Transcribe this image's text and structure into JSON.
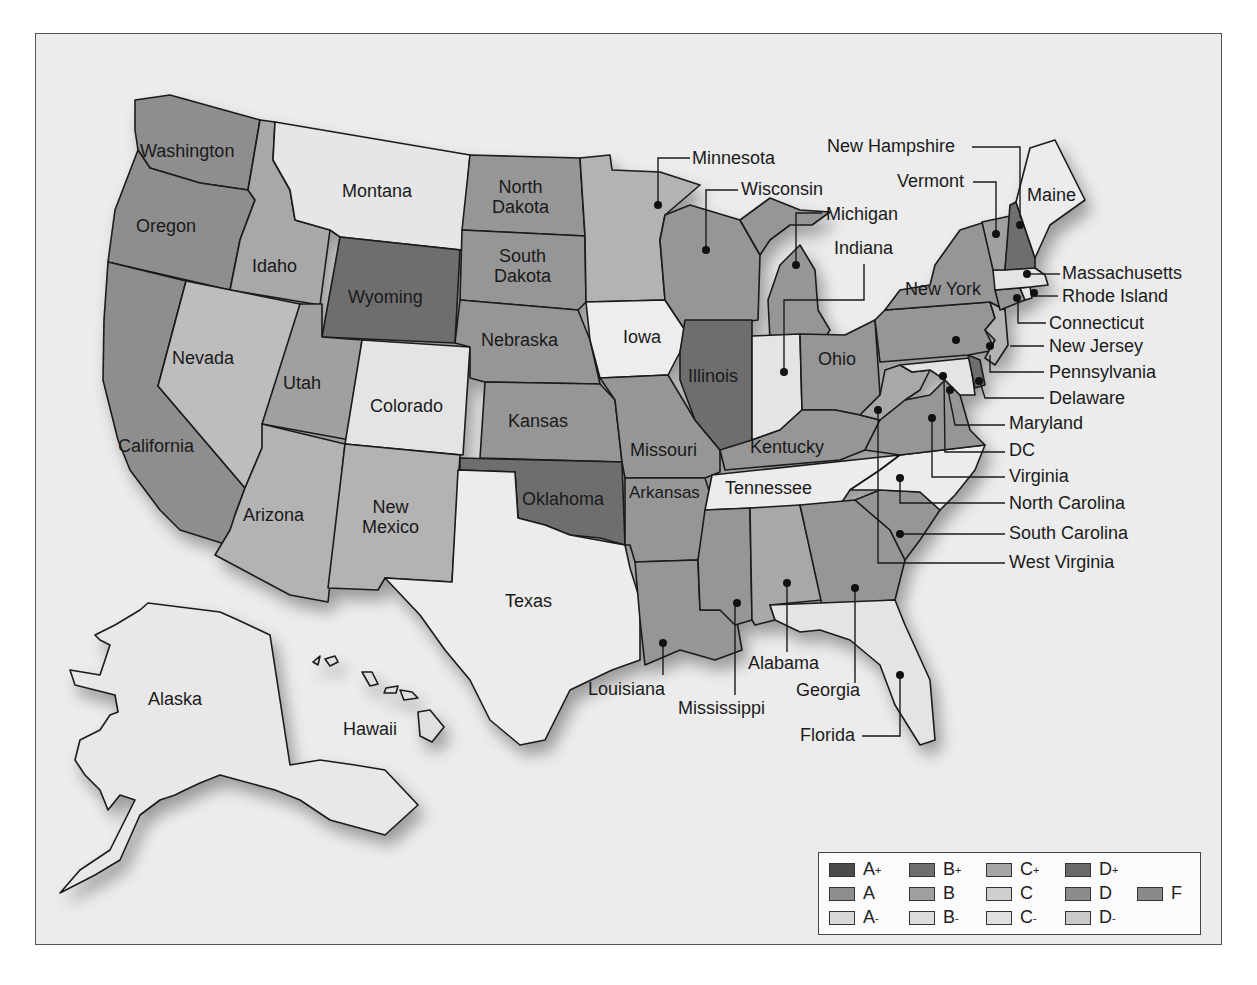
{
  "map": {
    "title_cutoff_visible": false,
    "states": [
      {
        "name": "Washington",
        "shade": "#8e8e8e",
        "grade_est": "A"
      },
      {
        "name": "Oregon",
        "shade": "#8e8e8e",
        "grade_est": "A"
      },
      {
        "name": "California",
        "shade": "#8e8e8e",
        "grade_est": "A"
      },
      {
        "name": "Idaho",
        "shade": "#a8a8a8",
        "grade_est": "B"
      },
      {
        "name": "Nevada",
        "shade": "#bdbdbd",
        "grade_est": "C"
      },
      {
        "name": "Montana",
        "shade": "#e6e6e6",
        "grade_est": "A-"
      },
      {
        "name": "Wyoming",
        "shade": "#6e6e6e",
        "grade_est": "D+"
      },
      {
        "name": "Utah",
        "shade": "#a0a0a0",
        "grade_est": "B"
      },
      {
        "name": "Colorado",
        "shade": "#e4e4e4",
        "grade_est": "B-"
      },
      {
        "name": "Arizona",
        "shade": "#b3b3b3",
        "grade_est": "C+"
      },
      {
        "name": "New Mexico",
        "shade": "#b3b3b3",
        "grade_est": "C+"
      },
      {
        "name": "North Dakota",
        "shade": "#969696",
        "grade_est": "A"
      },
      {
        "name": "South Dakota",
        "shade": "#969696",
        "grade_est": "A"
      },
      {
        "name": "Nebraska",
        "shade": "#969696",
        "grade_est": "A"
      },
      {
        "name": "Kansas",
        "shade": "#969696",
        "grade_est": "A"
      },
      {
        "name": "Oklahoma",
        "shade": "#6e6e6e",
        "grade_est": "D+"
      },
      {
        "name": "Texas",
        "shade": "#ececec",
        "grade_est": "C-"
      },
      {
        "name": "Minnesota",
        "shade": "#b3b3b3",
        "grade_est": "C+"
      },
      {
        "name": "Iowa",
        "shade": "#ededed",
        "grade_est": "A-"
      },
      {
        "name": "Missouri",
        "shade": "#969696",
        "grade_est": "A"
      },
      {
        "name": "Arkansas",
        "shade": "#969696",
        "grade_est": "A"
      },
      {
        "name": "Louisiana",
        "shade": "#969696",
        "grade_est": "A"
      },
      {
        "name": "Wisconsin",
        "shade": "#969696",
        "grade_est": "A"
      },
      {
        "name": "Illinois",
        "shade": "#6e6e6e",
        "grade_est": "D+"
      },
      {
        "name": "Michigan",
        "shade": "#969696",
        "grade_est": "A"
      },
      {
        "name": "Indiana",
        "shade": "#e4e4e4",
        "grade_est": "B-"
      },
      {
        "name": "Ohio",
        "shade": "#969696",
        "grade_est": "A"
      },
      {
        "name": "Kentucky",
        "shade": "#969696",
        "grade_est": "A"
      },
      {
        "name": "Tennessee",
        "shade": "#ececec",
        "grade_est": "C-"
      },
      {
        "name": "Mississippi",
        "shade": "#969696",
        "grade_est": "A"
      },
      {
        "name": "Alabama",
        "shade": "#a8a8a8",
        "grade_est": "B"
      },
      {
        "name": "Georgia",
        "shade": "#969696",
        "grade_est": "A"
      },
      {
        "name": "Florida",
        "shade": "#e4e4e4",
        "grade_est": "B-"
      },
      {
        "name": "South Carolina",
        "shade": "#969696",
        "grade_est": "A"
      },
      {
        "name": "North Carolina",
        "shade": "#ececec",
        "grade_est": "C-"
      },
      {
        "name": "Virginia",
        "shade": "#969696",
        "grade_est": "A"
      },
      {
        "name": "West Virginia",
        "shade": "#a8a8a8",
        "grade_est": "B"
      },
      {
        "name": "DC",
        "shade": "#e4e4e4",
        "grade_est": "B-"
      },
      {
        "name": "Maryland",
        "shade": "#e4e4e4",
        "grade_est": "B-"
      },
      {
        "name": "Delaware",
        "shade": "#6e6e6e",
        "grade_est": "D+"
      },
      {
        "name": "Pennsylvania",
        "shade": "#969696",
        "grade_est": "A"
      },
      {
        "name": "New Jersey",
        "shade": "#b3b3b3",
        "grade_est": "C+"
      },
      {
        "name": "New York",
        "shade": "#969696",
        "grade_est": "A"
      },
      {
        "name": "Connecticut",
        "shade": "#969696",
        "grade_est": "A"
      },
      {
        "name": "Rhode Island",
        "shade": "#e4e4e4",
        "grade_est": "B-"
      },
      {
        "name": "Massachusetts",
        "shade": "#e4e4e4",
        "grade_est": "B-"
      },
      {
        "name": "Vermont",
        "shade": "#a0a0a0",
        "grade_est": "B"
      },
      {
        "name": "New Hampshire",
        "shade": "#6e6e6e",
        "grade_est": "D+"
      },
      {
        "name": "Maine",
        "shade": "#ececec",
        "grade_est": "A-"
      },
      {
        "name": "Alaska",
        "shade": "#e8e8e8",
        "grade_est": "A-"
      },
      {
        "name": "Hawaii",
        "shade": "#e0e0e0",
        "grade_est": "A-"
      }
    ],
    "labels": {
      "washington": "Washington",
      "oregon": "Oregon",
      "california": "California",
      "idaho": "Idaho",
      "nevada": "Nevada",
      "montana": "Montana",
      "wyoming": "Wyoming",
      "utah": "Utah",
      "colorado": "Colorado",
      "arizona": "Arizona",
      "new_mexico_1": "New",
      "new_mexico_2": "Mexico",
      "north_dakota_1": "North",
      "north_dakota_2": "Dakota",
      "south_dakota_1": "South",
      "south_dakota_2": "Dakota",
      "nebraska": "Nebraska",
      "kansas": "Kansas",
      "oklahoma": "Oklahoma",
      "texas": "Texas",
      "minnesota": "Minnesota",
      "iowa": "Iowa",
      "missouri": "Missouri",
      "arkansas": "Arkansas",
      "louisiana": "Louisiana",
      "wisconsin": "Wisconsin",
      "illinois": "Illinois",
      "michigan": "Michigan",
      "indiana": "Indiana",
      "ohio": "Ohio",
      "kentucky": "Kentucky",
      "tennessee": "Tennessee",
      "mississippi": "Mississippi",
      "alabama": "Alabama",
      "georgia": "Georgia",
      "florida": "Florida",
      "south_carolina": "South Carolina",
      "north_carolina": "North Carolina",
      "virginia": "Virginia",
      "west_virginia": "West Virginia",
      "dc": "DC",
      "maryland": "Maryland",
      "delaware": "Delaware",
      "pennsylvania": "Pennsylvania",
      "new_jersey": "New Jersey",
      "new_york": "New York",
      "connecticut": "Connecticut",
      "rhode_island": "Rhode Island",
      "massachusetts": "Massachusetts",
      "vermont": "Vermont",
      "new_hampshire": "New Hampshire",
      "maine": "Maine",
      "alaska": "Alaska",
      "hawaii": "Hawaii"
    }
  },
  "legend": {
    "items": [
      {
        "grade": "A",
        "sup": "+",
        "color": "#4a4a4a"
      },
      {
        "grade": "B",
        "sup": "+",
        "color": "#6e6e6e"
      },
      {
        "grade": "C",
        "sup": "+",
        "color": "#a6a6a6"
      },
      {
        "grade": "D",
        "sup": "+",
        "color": "#6a6a6a"
      },
      {
        "grade": "A",
        "sup": "",
        "color": "#8e8e8e"
      },
      {
        "grade": "B",
        "sup": "",
        "color": "#a0a0a0"
      },
      {
        "grade": "C",
        "sup": "",
        "color": "#cfcfcf"
      },
      {
        "grade": "D",
        "sup": "",
        "color": "#8c8c8c"
      },
      {
        "grade": "F",
        "sup": "",
        "color": "#8a8a8a"
      },
      {
        "grade": "A",
        "sup": "-",
        "color": "#d8d8d8"
      },
      {
        "grade": "B",
        "sup": "-",
        "color": "#dcdcdc"
      },
      {
        "grade": "C",
        "sup": "-",
        "color": "#e0e0e0"
      },
      {
        "grade": "D",
        "sup": "-",
        "color": "#cacaca"
      }
    ]
  }
}
